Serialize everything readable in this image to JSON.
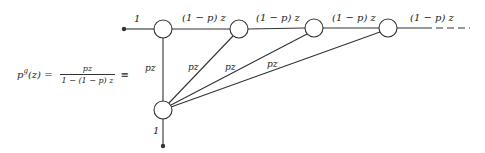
{
  "formula": {
    "lhs": "p",
    "lhs_sup": "g",
    "lhs_arg": "(z) =",
    "numerator": "pz",
    "denominator": "1 − (1 − p) z",
    "equiv": "≡"
  },
  "graph": {
    "input_label": "1",
    "output_label": "1",
    "forward_label": "(1 − p) z",
    "exit_label": "pz",
    "colors": {
      "stroke": "#333333",
      "node_fill": "#ffffff"
    },
    "nodes": [
      {
        "id": "n1",
        "x": 163,
        "y": 29
      },
      {
        "id": "n2",
        "x": 239,
        "y": 29
      },
      {
        "id": "n3",
        "x": 314,
        "y": 28
      },
      {
        "id": "n4",
        "x": 388,
        "y": 28
      },
      {
        "id": "sink",
        "x": 163,
        "y": 110
      }
    ],
    "forward_edges": [
      "(1 − p) z",
      "(1 − p) z",
      "(1 − p) z",
      "(1 − p) z"
    ],
    "exit_edges": [
      "pz",
      "pz",
      "pz",
      "pz"
    ]
  }
}
